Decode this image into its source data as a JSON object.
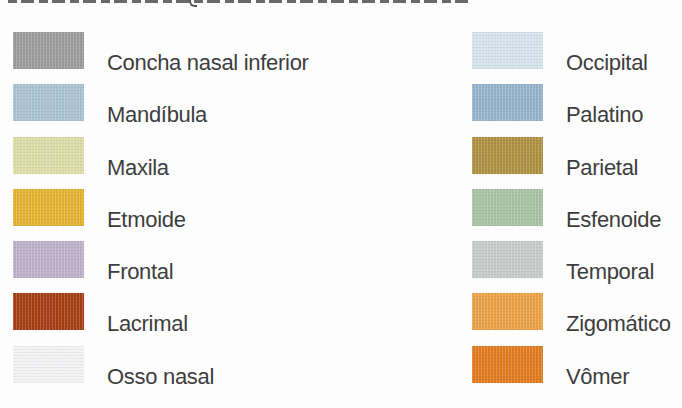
{
  "page": {
    "background": "#fdfdfd",
    "text_color": "#3d3d3d"
  },
  "legend": {
    "columns": [
      {
        "items": [
          {
            "label": "Concha nasal inferior",
            "color": "#9b9b9b"
          },
          {
            "label": "Mandíbula",
            "color": "#a9c3d3"
          },
          {
            "label": "Maxila",
            "color": "#dcdda6"
          },
          {
            "label": "Etmoide",
            "color": "#e2b231"
          },
          {
            "label": "Frontal",
            "color": "#bfb0ca"
          },
          {
            "label": "Lacrimal",
            "color": "#a53d12"
          },
          {
            "label": "Osso nasal",
            "color": "#f2f2f4"
          }
        ]
      },
      {
        "items": [
          {
            "label": "Occipital",
            "color": "#d5e3ec"
          },
          {
            "label": "Palatino",
            "color": "#94b3cb"
          },
          {
            "label": "Parietal",
            "color": "#ad9040"
          },
          {
            "label": "Esfenoide",
            "color": "#a7c2a2"
          },
          {
            "label": "Temporal",
            "color": "#c7cbc8"
          },
          {
            "label": "Zigomático",
            "color": "#eba145"
          },
          {
            "label": "Vômer",
            "color": "#e07a1d"
          }
        ]
      }
    ]
  }
}
